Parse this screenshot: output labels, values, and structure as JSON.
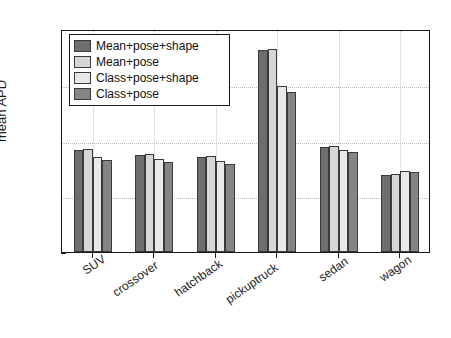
{
  "chart_data": {
    "type": "bar",
    "title": "",
    "xlabel": "",
    "ylabel": "mean APD",
    "ylim": [
      0,
      40
    ],
    "yticks": [
      0,
      10,
      20,
      30,
      40
    ],
    "ytick_labels": [
      "0",
      "10",
      "20",
      "30",
      "40"
    ],
    "grid": true,
    "legend_position": "upper left",
    "categories": [
      "SUV",
      "crossover",
      "hatchback",
      "pickuptruck",
      "sedan",
      "wagon"
    ],
    "series": [
      {
        "name": "Mean+pose+shape",
        "color": "#6e6e6e",
        "values": [
          18.3,
          17.4,
          17.1,
          36.2,
          18.8,
          13.8
        ]
      },
      {
        "name": "Mean+pose",
        "color": "#d6d6d6",
        "values": [
          18.4,
          17.5,
          17.2,
          36.4,
          19.1,
          14.0
        ]
      },
      {
        "name": "Class+pose+shape",
        "color": "#e8e8e8",
        "values": [
          17.0,
          16.6,
          16.4,
          29.8,
          18.3,
          14.6
        ]
      },
      {
        "name": "Class+pose",
        "color": "#858585",
        "values": [
          16.5,
          16.1,
          15.8,
          28.7,
          18.0,
          14.4
        ]
      }
    ]
  },
  "axis": {
    "ylabel": "mean APD"
  },
  "colors": {
    "axis": "#1a1a1a",
    "grid": "#b9b9b9",
    "background": "#ffffff",
    "bar_edge": "#3a3a3a"
  }
}
